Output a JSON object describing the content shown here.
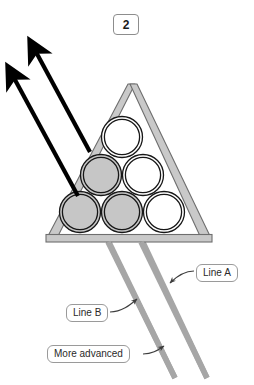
{
  "figure": {
    "title": "",
    "step_badge": {
      "label": "2",
      "name": "step-number-badge"
    },
    "background_color": "#ffffff"
  },
  "colors": {
    "arrow": "#000000",
    "rack_fill": "#c9c9c9",
    "rack_outline": "#6b6b6b",
    "ball_filled": "#c6c6c6",
    "ball_empty": "#ffffff",
    "ball_outline": "#1a1a1a",
    "line_gray": "#a0a0a0",
    "callout_border": "#9a9a9a",
    "callout_text": "#2a2a2a",
    "leader_line": "#4a4a4a"
  },
  "callouts": [
    {
      "id": "line-a",
      "label": "Line A",
      "x": 196,
      "y": 264,
      "points_to": "right-gray-line"
    },
    {
      "id": "line-b",
      "label": "Line B",
      "x": 66,
      "y": 304,
      "points_to": "left-gray-line"
    },
    {
      "id": "more-advanced",
      "label": "More advanced",
      "x": 47,
      "y": 345,
      "points_to": "left-gray-line-lower"
    }
  ],
  "rack": {
    "name": "triangular-rack",
    "apex": {
      "x": 129,
      "y": 84
    },
    "base_left": {
      "x": 48,
      "y": 236
    },
    "base_right": {
      "x": 210,
      "y": 236
    },
    "base_bar": {
      "x": 46,
      "y": 235,
      "width": 166,
      "height": 7
    }
  },
  "balls": [
    {
      "id": "ball-top",
      "row": 1,
      "col": 1,
      "cx": 122,
      "cy": 137,
      "r": 20,
      "state": "empty"
    },
    {
      "id": "ball-mid-left",
      "row": 2,
      "col": 1,
      "cx": 101,
      "cy": 175,
      "r": 20,
      "state": "filled"
    },
    {
      "id": "ball-mid-right",
      "row": 2,
      "col": 2,
      "cx": 143,
      "cy": 175,
      "r": 20,
      "state": "empty"
    },
    {
      "id": "ball-bottom-left",
      "row": 3,
      "col": 1,
      "cx": 80,
      "cy": 212,
      "r": 20,
      "state": "filled"
    },
    {
      "id": "ball-bottom-center",
      "row": 3,
      "col": 2,
      "cx": 122,
      "cy": 212,
      "r": 20,
      "state": "filled"
    },
    {
      "id": "ball-bottom-right",
      "row": 3,
      "col": 3,
      "cx": 164,
      "cy": 212,
      "r": 20,
      "state": "empty"
    }
  ],
  "arrows": [
    {
      "id": "arrow-upper",
      "name": "motion-arrow-1",
      "from": {
        "x": 90,
        "y": 152
      },
      "to": {
        "x": 33,
        "y": 47
      }
    },
    {
      "id": "arrow-lower",
      "name": "motion-arrow-2",
      "from": {
        "x": 78,
        "y": 196
      },
      "to": {
        "x": 11,
        "y": 73
      }
    }
  ],
  "gray_lines": [
    {
      "id": "left-gray-line",
      "name": "guide-line-b",
      "from": {
        "x": 106,
        "y": 240
      },
      "to": {
        "x": 175,
        "y": 378
      }
    },
    {
      "id": "right-gray-line",
      "name": "guide-line-a",
      "from": {
        "x": 140,
        "y": 240
      },
      "to": {
        "x": 207,
        "y": 378
      }
    }
  ]
}
